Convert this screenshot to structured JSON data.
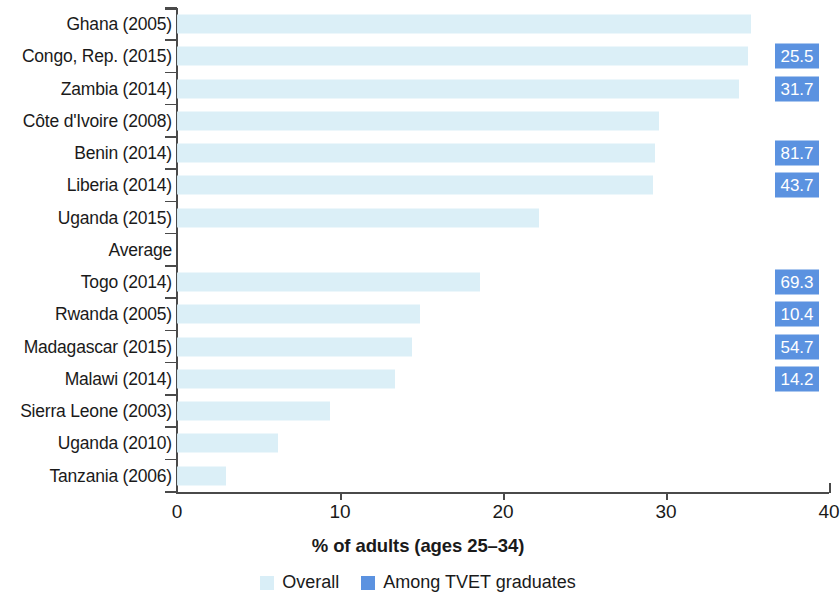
{
  "chart_data": {
    "type": "bar",
    "orientation": "horizontal",
    "title": "",
    "xlabel": "% of adults (ages 25–34)",
    "ylabel": "",
    "xlim": [
      0,
      40
    ],
    "xticks": [
      0,
      10,
      20,
      30,
      40
    ],
    "xtick_labels": [
      "0",
      "10",
      "20",
      "30",
      "40"
    ],
    "grid": false,
    "legend_position": "bottom",
    "categories": [
      "Ghana (2005)",
      "Congo, Rep. (2015)",
      "Zambia (2014)",
      "Côte d'Ivoire (2008)",
      "Benin (2014)",
      "Liberia (2014)",
      "Uganda (2015)",
      "Average",
      "Togo (2014)",
      "Rwanda (2005)",
      "Madagascar (2015)",
      "Malawi (2014)",
      "Sierra Leone (2003)",
      "Uganda (2010)",
      "Tanzania (2006)"
    ],
    "series": [
      {
        "name": "Overall",
        "color": "#d9eef7",
        "values": [
          35.2,
          35.0,
          34.5,
          29.6,
          29.3,
          29.2,
          22.2,
          null,
          18.6,
          14.9,
          14.4,
          13.4,
          9.4,
          6.2,
          3.0
        ]
      },
      {
        "name": "Among TVET graduates",
        "color": "#5b92e0",
        "values": [
          null,
          25.5,
          31.7,
          null,
          81.7,
          43.7,
          null,
          null,
          69.3,
          10.4,
          54.7,
          14.2,
          null,
          null,
          null
        ],
        "labels": [
          "",
          "25.5",
          "31.7",
          "",
          "81.7",
          "43.7",
          "",
          "",
          "69.3",
          "10.4",
          "54.7",
          "14.2",
          "",
          "",
          ""
        ],
        "note": "shown as value badges at right margin, not as drawn bars"
      }
    ],
    "legend": [
      {
        "label": "Overall",
        "color": "#d9eef7"
      },
      {
        "label": "Among TVET graduates",
        "color": "#5b92e0"
      }
    ]
  },
  "rows": [
    {
      "label": "Ghana (2005)",
      "overall": 35.2,
      "badge": ""
    },
    {
      "label": "Congo, Rep. (2015)",
      "overall": 35.0,
      "badge": "25.5"
    },
    {
      "label": "Zambia (2014)",
      "overall": 34.5,
      "badge": "31.7"
    },
    {
      "label": "Côte d'Ivoire (2008)",
      "overall": 29.6,
      "badge": ""
    },
    {
      "label": "Benin (2014)",
      "overall": 29.3,
      "badge": "81.7"
    },
    {
      "label": "Liberia (2014)",
      "overall": 29.2,
      "badge": "43.7"
    },
    {
      "label": "Uganda (2015)",
      "overall": 22.2,
      "badge": ""
    },
    {
      "label": "Average",
      "overall": null,
      "badge": ""
    },
    {
      "label": "Togo (2014)",
      "overall": 18.6,
      "badge": "69.3"
    },
    {
      "label": "Rwanda (2005)",
      "overall": 14.9,
      "badge": "10.4"
    },
    {
      "label": "Madagascar (2015)",
      "overall": 14.4,
      "badge": "54.7"
    },
    {
      "label": "Malawi (2014)",
      "overall": 13.4,
      "badge": "14.2"
    },
    {
      "label": "Sierra Leone (2003)",
      "overall": 9.4,
      "badge": ""
    },
    {
      "label": "Uganda (2010)",
      "overall": 6.2,
      "badge": ""
    },
    {
      "label": "Tanzania (2006)",
      "overall": 3.0,
      "badge": ""
    }
  ],
  "axis": {
    "x_title": "% of adults (ages 25–34)",
    "ticks": [
      "0",
      "10",
      "20",
      "30",
      "40"
    ]
  },
  "legend": {
    "overall_label": "Overall",
    "tvet_label": "Among TVET graduates",
    "overall_color": "#d9eef7",
    "tvet_color": "#5b92e0"
  }
}
